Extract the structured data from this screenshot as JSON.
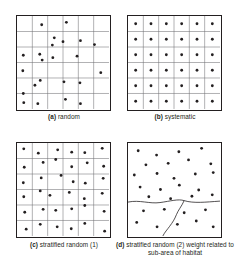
{
  "figure": {
    "type": "scientific-diagram",
    "panel_count": 4,
    "colors": {
      "background": "#ffffff",
      "border": "#231f20",
      "gridline": "#6d6e71",
      "dot": "#231f20",
      "habitat_line": "#231f20"
    },
    "geometry": {
      "plot_size": 95,
      "grid_divisions": 6,
      "dot_radius": 1.45,
      "border_width": 1.5,
      "gridline_width": 0.55
    }
  },
  "panels": [
    {
      "id": "a",
      "tag": "(a)",
      "label": "random",
      "caption": "random",
      "grid": true,
      "grid_divisions": 6,
      "sample_count": 22,
      "points": [
        [
          25.5,
          9.0
        ],
        [
          51.0,
          6.5
        ],
        [
          38.5,
          22.5
        ],
        [
          36.5,
          30.0
        ],
        [
          47.5,
          26.5
        ],
        [
          65.5,
          25.5
        ],
        [
          80.0,
          29.5
        ],
        [
          6.5,
          40.5
        ],
        [
          23.5,
          39.5
        ],
        [
          26.0,
          45.5
        ],
        [
          37.0,
          43.0
        ],
        [
          62.0,
          41.5
        ],
        [
          6.0,
          56.5
        ],
        [
          86.5,
          58.5
        ],
        [
          18.5,
          71.5
        ],
        [
          24.0,
          66.5
        ],
        [
          48.5,
          68.0
        ],
        [
          65.0,
          69.0
        ],
        [
          6.5,
          80.0
        ],
        [
          7.0,
          89.5
        ],
        [
          21.5,
          90.5
        ],
        [
          50.0,
          86.0
        ],
        [
          65.5,
          90.5
        ]
      ]
    },
    {
      "id": "b",
      "tag": "(b)",
      "label": "systematic",
      "caption": "systematic",
      "grid": true,
      "grid_divisions": 6,
      "sample_count": 36,
      "description": "one sample at the centre of every grid cell"
    },
    {
      "id": "c",
      "tag": "(c)",
      "label": "stratified random (1)",
      "caption": "stratified random (1)",
      "grid": true,
      "grid_divisions": 6,
      "sample_count": 36,
      "description": "one random sample within every grid cell",
      "points": [
        [
          7.0,
          6.0
        ],
        [
          22.0,
          10.5
        ],
        [
          42.0,
          7.0
        ],
        [
          56.5,
          9.5
        ],
        [
          70.0,
          10.0
        ],
        [
          88.0,
          5.5
        ],
        [
          7.5,
          25.0
        ],
        [
          27.0,
          20.0
        ],
        [
          40.0,
          17.0
        ],
        [
          56.5,
          24.5
        ],
        [
          72.5,
          20.5
        ],
        [
          89.5,
          24.0
        ],
        [
          6.5,
          41.0
        ],
        [
          25.0,
          36.0
        ],
        [
          45.5,
          33.5
        ],
        [
          58.0,
          40.0
        ],
        [
          70.5,
          41.5
        ],
        [
          89.0,
          36.5
        ],
        [
          7.0,
          55.5
        ],
        [
          24.0,
          49.5
        ],
        [
          34.0,
          54.0
        ],
        [
          54.0,
          51.0
        ],
        [
          69.5,
          57.5
        ],
        [
          88.0,
          52.0
        ],
        [
          8.0,
          71.5
        ],
        [
          27.0,
          68.5
        ],
        [
          40.0,
          69.5
        ],
        [
          56.5,
          68.0
        ],
        [
          70.0,
          64.5
        ],
        [
          90.0,
          70.5
        ],
        [
          9.5,
          89.0
        ],
        [
          24.0,
          84.0
        ],
        [
          41.5,
          86.5
        ],
        [
          56.0,
          88.5
        ],
        [
          70.0,
          83.0
        ],
        [
          90.5,
          91.0
        ]
      ]
    },
    {
      "id": "d",
      "tag": "(d)",
      "label": "stratified random (2) weight related to sub-area of habitat",
      "caption": "stratified random (2) weight\nrelated to sub-area of habitat",
      "grid": false,
      "sample_count": 30,
      "description": "habitat sub-areas outlined by irregular boundaries; sample number weighted by sub-area",
      "boundaries": [
        "wavy horizontal habitat boundary across the plot at about 62% height",
        "curved vertical boundary descending from the horizontal line to the lower edge"
      ],
      "points": [
        [
          10.5,
          8.0
        ],
        [
          29.5,
          12.5
        ],
        [
          52.5,
          9.0
        ],
        [
          76.0,
          5.5
        ],
        [
          18.5,
          22.5
        ],
        [
          41.5,
          21.0
        ],
        [
          62.5,
          17.5
        ],
        [
          85.5,
          21.5
        ],
        [
          6.5,
          33.0
        ],
        [
          30.0,
          31.5
        ],
        [
          47.5,
          36.5
        ],
        [
          69.5,
          32.0
        ],
        [
          88.0,
          30.5
        ],
        [
          12.5,
          45.5
        ],
        [
          33.5,
          48.0
        ],
        [
          53.0,
          43.5
        ],
        [
          73.0,
          48.5
        ],
        [
          21.5,
          55.5
        ],
        [
          44.0,
          57.5
        ],
        [
          66.0,
          55.0
        ],
        [
          87.0,
          53.5
        ],
        [
          16.0,
          70.0
        ],
        [
          37.5,
          68.5
        ],
        [
          58.0,
          72.0
        ],
        [
          80.0,
          69.0
        ],
        [
          9.0,
          82.0
        ],
        [
          30.0,
          86.5
        ],
        [
          51.0,
          84.0
        ],
        [
          70.5,
          80.5
        ],
        [
          88.0,
          86.5
        ]
      ]
    }
  ]
}
